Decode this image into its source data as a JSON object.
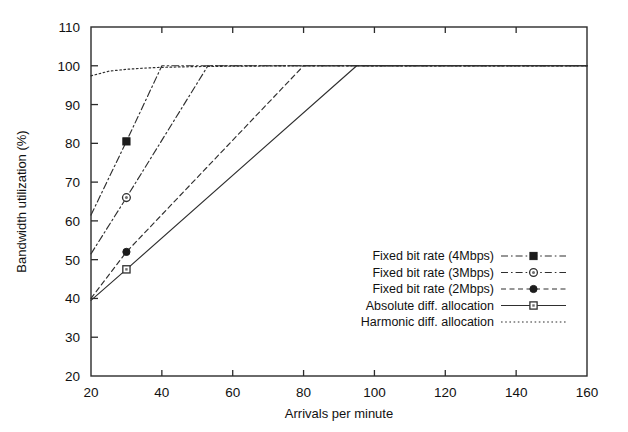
{
  "chart_data": {
    "type": "line",
    "title": "",
    "xlabel": "Arrivals per minute",
    "ylabel": "Bandwidth utilization (%)",
    "xlim": [
      20,
      160
    ],
    "ylim": [
      20,
      110
    ],
    "xticks": [
      20,
      40,
      60,
      80,
      100,
      120,
      140,
      160
    ],
    "yticks": [
      20,
      30,
      40,
      50,
      60,
      70,
      80,
      90,
      100,
      110
    ],
    "grid": false,
    "legend_position": "center-right",
    "series": [
      {
        "name": "Fixed bit rate (4Mbps)",
        "marker": "filled-square",
        "linestyle": "dash-dot",
        "color": "#2f2f2f",
        "x": [
          20,
          30,
          40,
          60,
          80,
          100,
          120,
          140,
          160
        ],
        "y": [
          61.5,
          80.5,
          100,
          100,
          100,
          100,
          100,
          100,
          100
        ],
        "marker_points": [
          {
            "x": 30,
            "y": 80.5
          }
        ]
      },
      {
        "name": "Fixed bit rate (3Mbps)",
        "marker": "open-circle",
        "linestyle": "dash-dot",
        "color": "#2f2f2f",
        "x": [
          20,
          30,
          53,
          60,
          80,
          100,
          120,
          140,
          160
        ],
        "y": [
          51.5,
          66,
          100,
          100,
          100,
          100,
          100,
          100,
          100
        ],
        "marker_points": [
          {
            "x": 30,
            "y": 66
          }
        ]
      },
      {
        "name": "Fixed bit rate (2Mbps)",
        "marker": "filled-circle",
        "linestyle": "dashed",
        "color": "#2f2f2f",
        "x": [
          20,
          30,
          80,
          100,
          120,
          140,
          160
        ],
        "y": [
          40,
          52,
          100,
          100,
          100,
          100,
          100
        ],
        "marker_points": [
          {
            "x": 30,
            "y": 52
          }
        ]
      },
      {
        "name": "Absolute diff. allocation",
        "marker": "open-square",
        "linestyle": "solid",
        "color": "#2f2f2f",
        "x": [
          20,
          30,
          95,
          100,
          120,
          140,
          160
        ],
        "y": [
          39.5,
          47.5,
          100,
          100,
          100,
          100,
          100
        ],
        "marker_points": [
          {
            "x": 30,
            "y": 47.5
          }
        ]
      },
      {
        "name": "Harmonic diff. allocation",
        "marker": "none",
        "linestyle": "dotted",
        "color": "#2f2f2f",
        "x": [
          20,
          25,
          30,
          35,
          40,
          50,
          60,
          80,
          100,
          120,
          140,
          160
        ],
        "y": [
          97.4,
          98.6,
          99.1,
          99.4,
          99.6,
          99.8,
          99.9,
          100,
          100,
          100,
          100,
          100
        ],
        "marker_points": []
      }
    ]
  },
  "legend": {
    "items": [
      {
        "label": "Fixed bit rate (4Mbps)",
        "marker": "filled-square",
        "linestyle": "dash-dot"
      },
      {
        "label": "Fixed bit rate (3Mbps)",
        "marker": "open-circle",
        "linestyle": "dash-dot"
      },
      {
        "label": "Fixed bit rate (2Mbps)",
        "marker": "filled-circle",
        "linestyle": "dashed"
      },
      {
        "label": "Absolute diff. allocation",
        "marker": "open-square",
        "linestyle": "solid"
      },
      {
        "label": "Harmonic diff. allocation",
        "marker": "none",
        "linestyle": "dotted"
      }
    ]
  },
  "colors": {
    "line": "#2f2f2f",
    "axis": "#2b2b2b",
    "text": "#111111",
    "background": "#ffffff"
  }
}
